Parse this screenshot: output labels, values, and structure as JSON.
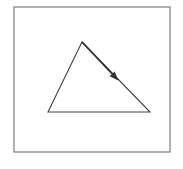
{
  "diagram": {
    "type": "triangle-with-direction-arrow",
    "frame": {
      "x": 14,
      "y": 7,
      "width": 156,
      "height": 145,
      "stroke": "#888888"
    },
    "triangle": {
      "vertices": [
        {
          "name": "apex",
          "x": 82,
          "y": 42
        },
        {
          "name": "bottom-right",
          "x": 150,
          "y": 112
        },
        {
          "name": "bottom-left",
          "x": 48,
          "y": 112
        }
      ],
      "stroke": "#444444"
    },
    "arrow": {
      "from": {
        "x": 82,
        "y": 42
      },
      "to": {
        "x": 117,
        "y": 79
      },
      "stroke": "#333333",
      "direction": "apex-to-bottom-right"
    }
  }
}
